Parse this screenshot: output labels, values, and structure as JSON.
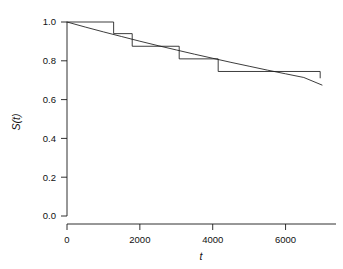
{
  "chart_data": {
    "type": "line",
    "title": "",
    "subtitle": "",
    "xlabel": "t",
    "ylabel": "S(t)",
    "xlim": [
      0,
      7000
    ],
    "ylim": [
      0.0,
      1.0
    ],
    "grid": false,
    "legend": null,
    "x_ticks": [
      0,
      2000,
      4000,
      6000
    ],
    "x_tick_labels": [
      "0",
      "2000",
      "4000",
      "6000"
    ],
    "y_ticks": [
      0.0,
      0.2,
      0.4,
      0.6,
      0.8,
      1.0
    ],
    "y_tick_labels": [
      "0.0",
      "0.2",
      "0.4",
      "0.6",
      "0.8",
      "1.0"
    ],
    "series": [
      {
        "name": "Kaplan-Meier step estimate",
        "type": "step",
        "step_mode": "post",
        "color": "#1a1a1a",
        "x": [
          0,
          1280,
          1280,
          1790,
          1790,
          3080,
          3080,
          4150,
          4150,
          6950,
          6950
        ],
        "y": [
          1.0,
          1.0,
          0.94,
          0.94,
          0.875,
          0.875,
          0.81,
          0.81,
          0.745,
          0.745,
          0.71
        ],
        "drop_times": [
          1280,
          1790,
          3080,
          4150,
          6950
        ],
        "levels": [
          1.0,
          0.94,
          0.875,
          0.81,
          0.745,
          0.71
        ]
      },
      {
        "name": "Fitted parametric survival curve",
        "type": "line",
        "color": "#1a1a1a",
        "x": [
          0,
          500,
          1000,
          1500,
          2000,
          2500,
          3000,
          3500,
          4000,
          4500,
          5000,
          5500,
          6000,
          6500,
          7000
        ],
        "y": [
          1.0,
          0.974,
          0.949,
          0.925,
          0.901,
          0.878,
          0.856,
          0.834,
          0.813,
          0.792,
          0.772,
          0.752,
          0.733,
          0.714,
          0.675
        ]
      }
    ]
  },
  "axes": {
    "x_axis_name": "t",
    "y_axis_name": "S(t)"
  }
}
